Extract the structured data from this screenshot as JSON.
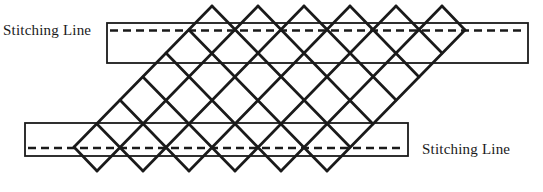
{
  "diagram": {
    "background_color": "#ffffff",
    "line_color": "#1a1a1a",
    "labels": {
      "top_stitching_line": "Stitching Line",
      "bottom_stitching_line": "Stitching Line"
    },
    "bands": [
      {
        "id": "top-band",
        "x": 107,
        "y": 23,
        "width": 421,
        "height": 40,
        "stroke_width": 1.8,
        "dash_line": {
          "y": 30.5,
          "x1": 110,
          "x2": 525
        }
      },
      {
        "id": "bottom-band",
        "x": 25,
        "y": 123,
        "width": 383,
        "height": 33,
        "stroke_width": 1.8,
        "dash_line": {
          "y": 148,
          "x1": 28,
          "x2": 405
        }
      }
    ],
    "dash_pattern": "8 5",
    "dash_stroke_width": 2.4,
    "lattice": {
      "stroke_width": 2.7,
      "ne_lines": [
        [
          74,
          147,
          212,
          6
        ],
        [
          97,
          171,
          258,
          6
        ],
        [
          143,
          171,
          304,
          6
        ],
        [
          189,
          171,
          350,
          6
        ],
        [
          235,
          171,
          396,
          6
        ],
        [
          281,
          171,
          442,
          6
        ],
        [
          327,
          171,
          465,
          30
        ]
      ],
      "se_lines": [
        [
          189,
          30,
          327,
          171
        ],
        [
          166,
          53,
          281,
          171
        ],
        [
          143,
          77,
          235,
          171
        ],
        [
          120,
          100,
          189,
          171
        ],
        [
          97,
          124,
          143,
          171
        ],
        [
          74,
          147,
          97,
          171
        ],
        [
          212,
          6,
          350,
          147
        ],
        [
          258,
          6,
          373,
          124
        ],
        [
          304,
          6,
          396,
          100
        ],
        [
          350,
          6,
          419,
          77
        ],
        [
          396,
          6,
          442,
          53
        ],
        [
          442,
          6,
          465,
          30
        ]
      ]
    }
  }
}
